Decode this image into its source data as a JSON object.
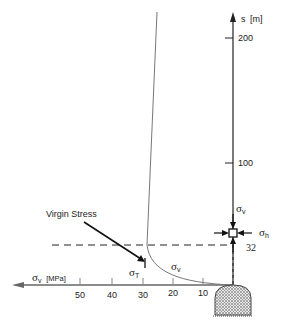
{
  "diagram": {
    "vertical_axis": {
      "label": "s",
      "unit": "[m]",
      "ticks": [
        "200",
        "100"
      ]
    },
    "horizontal_axis": {
      "label_symbol": "σ",
      "label_sub": "v",
      "unit": "[MPa]",
      "ticks": [
        "50",
        "40",
        "30",
        "20",
        "10"
      ]
    },
    "annotations": {
      "virgin_stress": "Virgin Stress",
      "sigma_t_symbol": "σ",
      "sigma_t_sub": "T",
      "sigma_v_curve_symbol": "σ",
      "sigma_v_curve_sub": "v",
      "element_sigma_v_symbol": "σ",
      "element_sigma_v_sub": "v",
      "element_sigma_h_symbol": "σ",
      "element_sigma_h_sub": "h",
      "depth_marker": "32"
    },
    "colors": {
      "line": "#333333",
      "hatch": "#555555",
      "curve": "#777777"
    }
  }
}
